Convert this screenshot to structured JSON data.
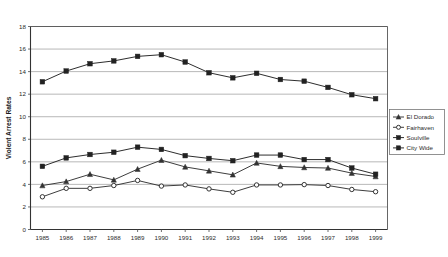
{
  "chart_data": {
    "type": "line",
    "title": "",
    "xlabel": "",
    "ylabel": "Violent Arrest Rates",
    "categories": [
      "1985",
      "1986",
      "1987",
      "1988",
      "1989",
      "1990",
      "1991",
      "1992",
      "1993",
      "1994",
      "1995",
      "1996",
      "1997",
      "1998",
      "1999"
    ],
    "ylim": [
      0,
      18
    ],
    "yticks": [
      0,
      2,
      4,
      6,
      8,
      10,
      12,
      14,
      16,
      18
    ],
    "grid": true,
    "legend_position": "right",
    "series": [
      {
        "name": "El Dorado",
        "marker": "triangle",
        "color": "#333333",
        "values": [
          3.9,
          4.25,
          4.9,
          4.4,
          5.35,
          6.15,
          5.55,
          5.2,
          4.85,
          5.9,
          5.6,
          5.5,
          5.45,
          5.0,
          4.7
        ]
      },
      {
        "name": "Fairhaven",
        "marker": "circle",
        "color": "#333333",
        "values": [
          2.9,
          3.65,
          3.65,
          3.9,
          4.35,
          3.85,
          3.95,
          3.6,
          3.3,
          3.95,
          3.95,
          3.98,
          3.9,
          3.55,
          3.35
        ]
      },
      {
        "name": "Soulville",
        "marker": "square",
        "color": "#222222",
        "values": [
          5.6,
          6.35,
          6.65,
          6.85,
          7.3,
          7.1,
          6.55,
          6.3,
          6.1,
          6.6,
          6.6,
          6.2,
          6.2,
          5.45,
          4.9
        ]
      },
      {
        "name": "City Wide",
        "marker": "square",
        "color": "#222222",
        "values": [
          13.1,
          14.05,
          14.7,
          14.95,
          15.35,
          15.5,
          14.85,
          13.9,
          13.45,
          13.85,
          13.3,
          13.15,
          12.6,
          11.95,
          11.6
        ]
      }
    ]
  },
  "legend": {
    "items": [
      {
        "label": "El Dorado"
      },
      {
        "label": "Fairhaven"
      },
      {
        "label": "Soulville"
      },
      {
        "label": "City Wide"
      }
    ]
  },
  "axes": {
    "y_title": "Violent Arrest Rates"
  }
}
